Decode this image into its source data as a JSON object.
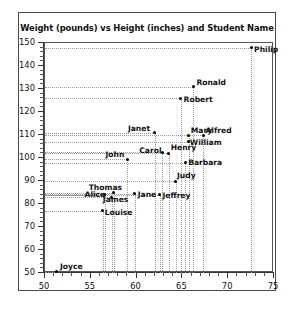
{
  "chart_data": {
    "type": "scatter",
    "title": "Weight (pounds) vs Height (inches) and Student Name",
    "xlabel": "",
    "ylabel": "",
    "xlim": [
      50,
      75
    ],
    "ylim": [
      50,
      150
    ],
    "xticks": [
      50,
      55,
      60,
      65,
      70,
      75
    ],
    "yticks": [
      50,
      60,
      70,
      80,
      90,
      100,
      110,
      120,
      130,
      140,
      150
    ],
    "x_minor_step": 1,
    "y_minor_step": 2,
    "grid": "dotted-drop-lines",
    "legend": "none",
    "point_color": "#000000",
    "grid_color": "#9a9a9a",
    "points": [
      {
        "name": "Philip",
        "x": 72.5,
        "y": 148,
        "label_dx": 3,
        "label_dy": 2
      },
      {
        "name": "Ronald",
        "x": 66.2,
        "y": 131,
        "label_dx": 3,
        "label_dy": -4
      },
      {
        "name": "Robert",
        "x": 64.8,
        "y": 126,
        "label_dx": 3,
        "label_dy": 2
      },
      {
        "name": "Janet",
        "x": 62.0,
        "y": 111,
        "label_dx": -27,
        "label_dy": -4
      },
      {
        "name": "Mary",
        "x": 65.7,
        "y": 110,
        "label_dx": 2,
        "label_dy": -4
      },
      {
        "name": "Alfred",
        "x": 67.3,
        "y": 110,
        "label_dx": 2,
        "label_dy": -4
      },
      {
        "name": "William",
        "x": 65.7,
        "y": 107,
        "label_dx": 1,
        "label_dy": 1
      },
      {
        "name": "Henry",
        "x": 63.5,
        "y": 102,
        "label_dx": 2,
        "label_dy": -5
      },
      {
        "name": "John",
        "x": 59.0,
        "y": 99.5,
        "label_dx": -22,
        "label_dy": -4
      },
      {
        "name": "Carol",
        "x": 62.8,
        "y": 102.5,
        "label_dx": -23,
        "label_dy": -1
      },
      {
        "name": "Barbara",
        "x": 65.3,
        "y": 98,
        "label_dx": 3,
        "label_dy": 0
      },
      {
        "name": "Judy",
        "x": 64.3,
        "y": 90,
        "label_dx": 1,
        "label_dy": -5
      },
      {
        "name": "Thomas",
        "x": 57.5,
        "y": 85,
        "label_dx": -25,
        "label_dy": -5
      },
      {
        "name": "Alice",
        "x": 56.5,
        "y": 84,
        "label_dx": -20,
        "label_dy": 0
      },
      {
        "name": "James",
        "x": 57.3,
        "y": 83,
        "label_dx": -9,
        "label_dy": 3
      },
      {
        "name": "Jane",
        "x": 59.8,
        "y": 84.5,
        "label_dx": 3,
        "label_dy": 1
      },
      {
        "name": "Jeffrey",
        "x": 62.5,
        "y": 84,
        "label_dx": 3,
        "label_dy": 1
      },
      {
        "name": "Louise",
        "x": 56.3,
        "y": 77,
        "label_dx": 2,
        "label_dy": 2
      },
      {
        "name": "Joyce",
        "x": 51.3,
        "y": 50.5,
        "label_dx": 3,
        "label_dy": -5
      }
    ]
  }
}
